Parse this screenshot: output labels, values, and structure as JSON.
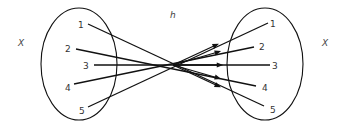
{
  "diagram": {
    "function_label": "h",
    "domain_set": {
      "label": "X",
      "elements": [
        "1",
        "2",
        "3",
        "4",
        "5"
      ]
    },
    "codomain_set": {
      "label": "X",
      "elements": [
        "1",
        "2",
        "3",
        "4",
        "5"
      ]
    },
    "mapping": [
      {
        "from": "1",
        "to": "5"
      },
      {
        "from": "2",
        "to": "4"
      },
      {
        "from": "3",
        "to": "3"
      },
      {
        "from": "4",
        "to": "2"
      },
      {
        "from": "5",
        "to": "1"
      }
    ],
    "colors": {
      "stroke": "#111111",
      "background": "#ffffff"
    }
  }
}
